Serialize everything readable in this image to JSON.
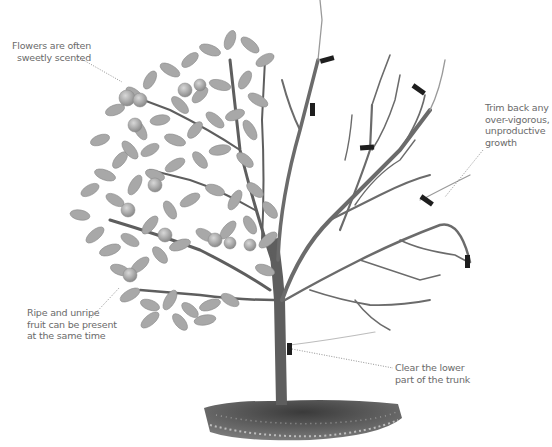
{
  "diagram": {
    "left_half": "Foliage with flowers and fruit",
    "right_half": "Bare branches with pruning cut marks",
    "cut_marks_count": 7,
    "colors": {
      "background": "#ffffff",
      "branch": "#6b6b6b",
      "leaf": "#a8a8a8",
      "cut_mark": "#1e1e1e",
      "soil": "#4a4a4a",
      "label_text": "#6a6a6a",
      "leader_line": "#777777"
    }
  },
  "annotations": [
    {
      "id": "flowers",
      "lines": [
        "Flowers are often",
        "sweetly scented"
      ]
    },
    {
      "id": "trim",
      "lines": [
        "Trim back any",
        "over-vigorous,",
        "unproductive",
        "growth"
      ]
    },
    {
      "id": "fruit",
      "lines": [
        "Ripe and unripe",
        "fruit can be present",
        "at the same time"
      ]
    },
    {
      "id": "trunk",
      "lines": [
        "Clear the lower",
        "part of the trunk"
      ]
    }
  ]
}
